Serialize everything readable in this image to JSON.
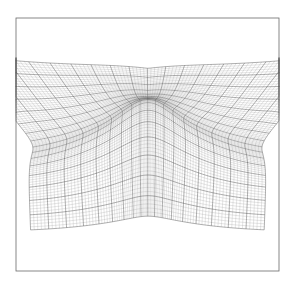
{
  "figure": {
    "width": 297,
    "height": 284,
    "frame": {
      "x0": 16,
      "y0": 18,
      "x1": 279,
      "y1": 271
    },
    "background": "#ffffff",
    "line_color": "#9a9a9a",
    "major_line_color": "#5a5a5a",
    "frame_color": "#6a6a6a",
    "grid": {
      "columns": 90,
      "rows": 80,
      "major_every": 5
    },
    "arch": {
      "center_x": 148,
      "peak_y": 106,
      "half_width": 62
    }
  }
}
